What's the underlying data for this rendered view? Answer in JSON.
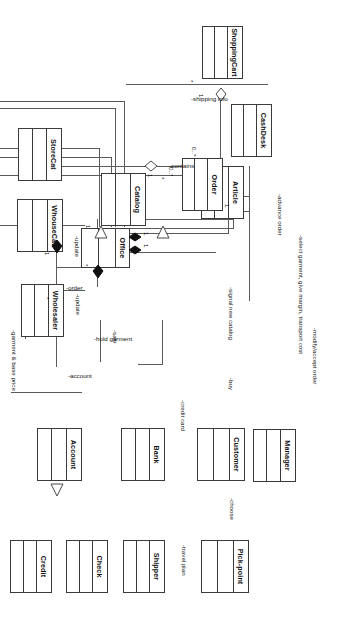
{
  "diagram": {
    "notation": "UML class diagram",
    "orientation": "rotated-90-clockwise",
    "background_color": "#ffffff",
    "line_color": "#5a5a5a",
    "border_color": "#3a3a3a",
    "text_color": "#111111"
  },
  "classes": [
    {
      "id": "shoppingcart",
      "name": "ShoppingCart"
    },
    {
      "id": "article",
      "name": "Article"
    },
    {
      "id": "cashdesk",
      "name": "CashDesk"
    },
    {
      "id": "order",
      "name": "Order"
    },
    {
      "id": "catalog",
      "name": "Catalog"
    },
    {
      "id": "storecat",
      "name": "StoreCat"
    },
    {
      "id": "whousecat",
      "name": "WhouseCat"
    },
    {
      "id": "office",
      "name": "Office"
    },
    {
      "id": "wholesaler",
      "name": "Wholesaler"
    },
    {
      "id": "manager",
      "name": "Manager"
    },
    {
      "id": "customer",
      "name": "Customer"
    },
    {
      "id": "bank",
      "name": "Bank"
    },
    {
      "id": "account",
      "name": "Account"
    },
    {
      "id": "pickpoint",
      "name": "Pick-point"
    },
    {
      "id": "shipper",
      "name": "Shipper"
    },
    {
      "id": "check",
      "name": "Check"
    },
    {
      "id": "credit",
      "name": "Credit"
    }
  ],
  "edge_labels": [
    {
      "id": "shipping_info",
      "text": "-shipping info"
    },
    {
      "id": "contains",
      "text": "-contains"
    },
    {
      "id": "advance_order",
      "text": "-advance order"
    },
    {
      "id": "modify_accept",
      "text": "-modify/accept order"
    },
    {
      "id": "select_garment",
      "text": "-select garment, give margin, transport cost"
    },
    {
      "id": "sale",
      "text": "-sale"
    },
    {
      "id": "signal_catalog",
      "text": "-signal new catalog"
    },
    {
      "id": "buy",
      "text": "-buy"
    },
    {
      "id": "hold_garment",
      "text": "-hold garment"
    },
    {
      "id": "credit_card",
      "text": "-credit card"
    },
    {
      "id": "account_lbl",
      "text": "-account"
    },
    {
      "id": "order_lbl",
      "text": "-order"
    },
    {
      "id": "update_catalog",
      "text": "-update"
    },
    {
      "id": "update_whole",
      "text": "-update"
    },
    {
      "id": "garment_price",
      "text": "-garment & base price"
    },
    {
      "id": "choose",
      "text": "-choose"
    },
    {
      "id": "travel_plan",
      "text": "-travel plan"
    }
  ],
  "multiplicities": [
    {
      "id": "m_cart_1",
      "text": "1"
    },
    {
      "id": "m_cart_star",
      "text": "*"
    },
    {
      "id": "m_article_0n",
      "text": "0..*"
    },
    {
      "id": "m_cont_0n",
      "text": "0..*"
    },
    {
      "id": "m_cash_1",
      "text": "1"
    },
    {
      "id": "m_order_star",
      "text": "*"
    },
    {
      "id": "m_cat_1",
      "text": "1"
    },
    {
      "id": "m_off_1a",
      "text": "1"
    },
    {
      "id": "m_off_1b",
      "text": "1"
    },
    {
      "id": "m_upd_1",
      "text": "1"
    },
    {
      "id": "m_off_star",
      "text": "*"
    },
    {
      "id": "m_bank_1",
      "text": "1"
    },
    {
      "id": "m_acct_star",
      "text": "*"
    },
    {
      "id": "m_pick_1",
      "text": "1"
    },
    {
      "id": "m_pick_star",
      "text": "*"
    }
  ]
}
